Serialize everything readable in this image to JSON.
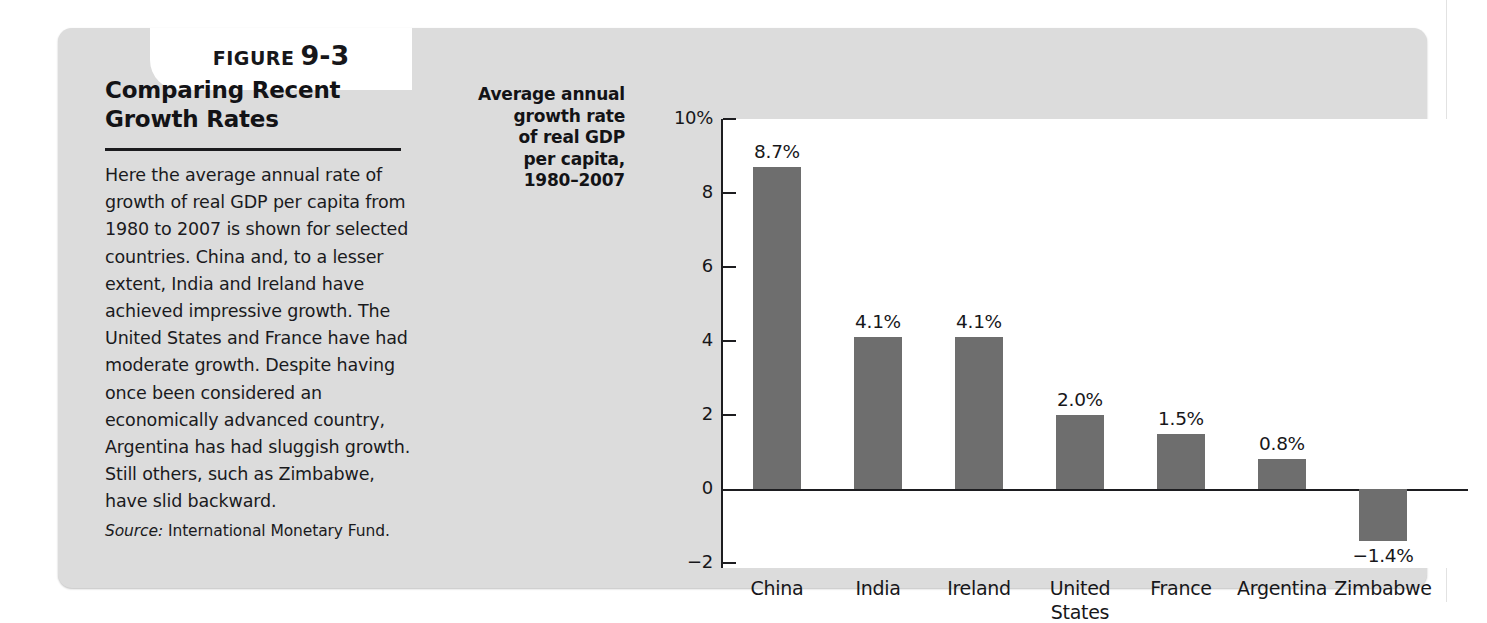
{
  "figure": {
    "label": "FIGURE",
    "number": "9-3",
    "title": "Comparing Recent Growth Rates",
    "body": "Here the average annual rate of growth of real GDP per capita from 1980 to 2007 is shown for selected countries. China and, to a lesser extent, India and Ireland have achieved impressive growth. The United States and France have had moderate growth. Despite having once been considered an economically advanced country, Argentina has had sluggish growth. Still others, such as Zimbabwe, have slid backward.",
    "source_label": "Source:",
    "source_text": "International Monetary Fund."
  },
  "chart_data": {
    "type": "bar",
    "title": "Comparing Recent Growth Rates",
    "ylabel": "Average annual growth rate of real GDP per capita, 1980–2007",
    "xlabel": "",
    "categories": [
      "China",
      "India",
      "Ireland",
      "United States",
      "France",
      "Argentina",
      "Zimbabwe"
    ],
    "values": [
      8.7,
      4.1,
      4.1,
      2.0,
      1.5,
      0.8,
      -1.4
    ],
    "value_labels": [
      "8.7%",
      "4.1%",
      "4.1%",
      "2.0%",
      "1.5%",
      "0.8%",
      "−1.4%"
    ],
    "ytick_labels": [
      "10%",
      "8",
      "6",
      "4",
      "2",
      "0",
      "−2"
    ],
    "yticks": [
      10,
      8,
      6,
      4,
      2,
      0,
      -2
    ],
    "ylim": [
      -2,
      10
    ],
    "grid": false,
    "legend": false,
    "bar_color": "#6e6e6e",
    "units": "percent"
  },
  "colors": {
    "panel_background": "#dcdcdc",
    "plot_background": "#ffffff",
    "bar": "#6e6e6e",
    "axis": "#1d1d20",
    "text": "#17171a"
  }
}
